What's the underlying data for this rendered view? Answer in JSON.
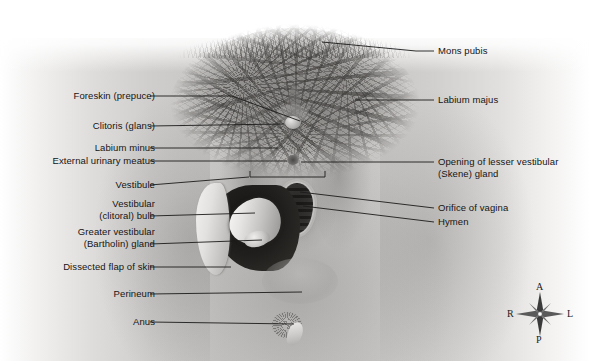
{
  "figure": {
    "style": "grayscale medical illustration"
  },
  "labels_left": [
    {
      "id": "foreskin-prepuce",
      "text": "Foreskin (prepuce)",
      "x": 45,
      "y": 90,
      "width": 110,
      "leader": "150,96 232,96 300,121"
    },
    {
      "id": "clitoris-glans",
      "text": "Clitoris (glans)",
      "x": 55,
      "y": 120,
      "width": 100,
      "leader": "150,126 284,124"
    },
    {
      "id": "labium-minus",
      "text": "Labium minus",
      "x": 55,
      "y": 142,
      "width": 100,
      "leader": "150,148 278,148"
    },
    {
      "id": "external-urinary-meatus",
      "text": "External urinary meatus",
      "x": 13,
      "y": 155,
      "width": 142,
      "leader": "150,161 287,161"
    },
    {
      "id": "vestibule",
      "text": "Vestibule",
      "x": 83,
      "y": 179,
      "width": 72,
      "leader": "150,185 249,177"
    },
    {
      "id": "vestibular-clitoral-bulb",
      "text": "Vestibular\n(clitoral) bulb",
      "x": 60,
      "y": 198,
      "width": 95,
      "leader": "150,216 255,213"
    },
    {
      "id": "greater-vestibular-bartholin-gland",
      "text": "Greater vestibular\n(Bartholin) gland",
      "x": 40,
      "y": 226,
      "width": 115,
      "leader": "150,244 262,240"
    },
    {
      "id": "dissected-flap-of-skin",
      "text": "Dissected flap of skin",
      "x": 26,
      "y": 261,
      "width": 129,
      "leader": "150,267 231,267"
    },
    {
      "id": "perineum",
      "text": "Perineum",
      "x": 83,
      "y": 288,
      "width": 72,
      "leader": "150,294 302,292"
    },
    {
      "id": "anus",
      "text": "Anus",
      "x": 110,
      "y": 316,
      "width": 45,
      "leader": "150,322 294,324"
    }
  ],
  "labels_right": [
    {
      "id": "mons-pubis",
      "text": "Mons pubis",
      "x": 438,
      "y": 45,
      "width": 120,
      "leader": "322,42 416,51 434,51"
    },
    {
      "id": "labium-majus",
      "text": "Labium majus",
      "x": 438,
      "y": 94,
      "width": 120,
      "leader": "355,100 434,100"
    },
    {
      "id": "opening-of-lesser-vestibular-skene-gland",
      "text": "Opening of lesser vestibular\n(Skene) gland",
      "x": 438,
      "y": 156,
      "width": 150,
      "leader": "301,162 434,162"
    },
    {
      "id": "orifice-of-vagina",
      "text": "Orifice of vagina",
      "x": 438,
      "y": 202,
      "width": 120,
      "leader": "300,192 434,208"
    },
    {
      "id": "hymen",
      "text": "Hymen",
      "x": 438,
      "y": 216,
      "width": 120,
      "leader": "303,206 434,222"
    }
  ],
  "brackets": [
    {
      "id": "vestibule-extent-bracket",
      "x1": 250,
      "x2": 325,
      "y": 177,
      "tick": 6
    }
  ],
  "compass": {
    "anterior": "A",
    "posterior": "P",
    "right": "R",
    "left": "L"
  },
  "colors": {
    "background": "#ffffff",
    "line": "#1b1b1b",
    "text": "#141414",
    "skin_mid": "#c2c0be",
    "cavity_dark": "#1d1b19"
  }
}
